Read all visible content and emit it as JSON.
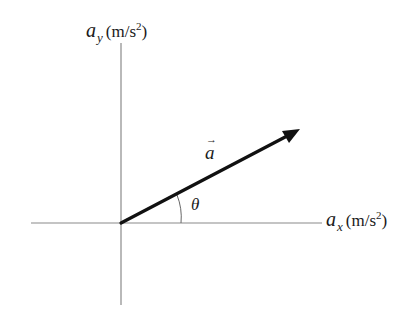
{
  "diagram": {
    "type": "vector-components-axes",
    "y_axis": {
      "variable": "a",
      "subscript": "y",
      "unit_open": "(m/s",
      "unit_exponent": "2",
      "unit_close": ")"
    },
    "x_axis": {
      "variable": "a",
      "subscript": "x",
      "unit_open": "(m/s",
      "unit_exponent": "2",
      "unit_close": ")"
    },
    "vector": {
      "symbol": "a",
      "arrow_glyph": "→",
      "color": "#111111"
    },
    "angle": {
      "symbol": "θ"
    },
    "colors": {
      "axis": "#8a8a8a",
      "text": "#1a1a1a",
      "background": "#ffffff"
    }
  }
}
